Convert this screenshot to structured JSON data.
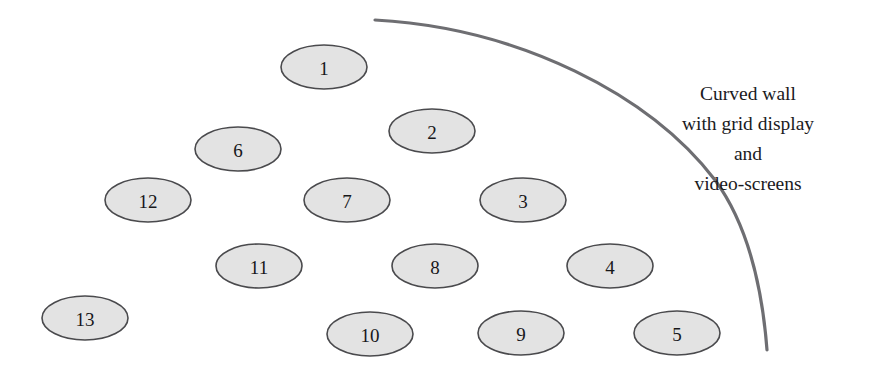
{
  "canvas": {
    "width": 881,
    "height": 375,
    "background": "#ffffff"
  },
  "colors": {
    "seat_fill": "#e3e3e3",
    "seat_stroke": "#4a4a4d",
    "seat_text": "#17171a",
    "wall_stroke": "#6e6e72",
    "annotation_text": "#1b1b1e"
  },
  "seats": {
    "shape": "ellipse",
    "radius_x": 43,
    "radius_y": 22,
    "items": [
      {
        "label": "1",
        "cx": 324,
        "cy": 67
      },
      {
        "label": "2",
        "cx": 432,
        "cy": 131
      },
      {
        "label": "3",
        "cx": 523,
        "cy": 200
      },
      {
        "label": "4",
        "cx": 610,
        "cy": 266
      },
      {
        "label": "5",
        "cx": 677,
        "cy": 333
      },
      {
        "label": "6",
        "cx": 238,
        "cy": 149
      },
      {
        "label": "7",
        "cx": 347,
        "cy": 200
      },
      {
        "label": "8",
        "cx": 435,
        "cy": 266
      },
      {
        "label": "9",
        "cx": 521,
        "cy": 333
      },
      {
        "label": "10",
        "cx": 370,
        "cy": 334
      },
      {
        "label": "11",
        "cx": 259,
        "cy": 266
      },
      {
        "label": "12",
        "cx": 148,
        "cy": 200
      },
      {
        "label": "13",
        "cx": 85,
        "cy": 318
      }
    ]
  },
  "wall": {
    "name": "curved-wall",
    "stroke_width": 3.2,
    "path": "M 375 20 C 520 28 650 95 715 180 C 748 225 762 285 767 350"
  },
  "annotation": {
    "align": "center",
    "center_x": 748,
    "first_line_y": 100,
    "line_height": 30,
    "lines": [
      "Curved wall",
      "with grid display",
      "and",
      "video-screens"
    ]
  }
}
